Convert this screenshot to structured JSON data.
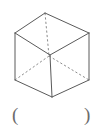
{
  "page": {
    "background_color": "#ffffff",
    "width": 111,
    "height": 126
  },
  "figure": {
    "name": "cube-wireframe",
    "stroke_color": "#5a5a5a",
    "hidden_stroke_color": "#8c8c8c",
    "stroke_width": 1,
    "hidden_dash_pattern": "2.2 2.2",
    "vertices": {
      "top_back": [
        45,
        13
      ],
      "top_left": [
        15,
        33
      ],
      "top_right": [
        89,
        33
      ],
      "top_front": [
        50,
        55
      ],
      "bottom_back_hidden": [
        49,
        56
      ],
      "bottom_left": [
        15,
        80
      ],
      "bottom_right": [
        89,
        80
      ],
      "bottom_front": [
        52,
        97
      ]
    },
    "visible_edges": [
      [
        [
          45,
          13
        ],
        [
          15,
          33
        ]
      ],
      [
        [
          45,
          13
        ],
        [
          89,
          33
        ]
      ],
      [
        [
          15,
          33
        ],
        [
          50,
          55
        ]
      ],
      [
        [
          89,
          33
        ],
        [
          50,
          55
        ]
      ],
      [
        [
          15,
          33
        ],
        [
          15,
          80
        ]
      ],
      [
        [
          89,
          33
        ],
        [
          89,
          80
        ]
      ],
      [
        [
          50,
          55
        ],
        [
          52,
          97
        ]
      ],
      [
        [
          15,
          80
        ],
        [
          52,
          97
        ]
      ],
      [
        [
          89,
          80
        ],
        [
          52,
          97
        ]
      ]
    ],
    "hidden_edges": [
      [
        [
          45,
          13
        ],
        [
          49,
          56
        ]
      ],
      [
        [
          49,
          56
        ],
        [
          15,
          80
        ]
      ],
      [
        [
          49,
          56
        ],
        [
          89,
          80
        ]
      ]
    ]
  },
  "answer_blank": {
    "left_paren": "(",
    "right_paren": ")",
    "value": ""
  }
}
